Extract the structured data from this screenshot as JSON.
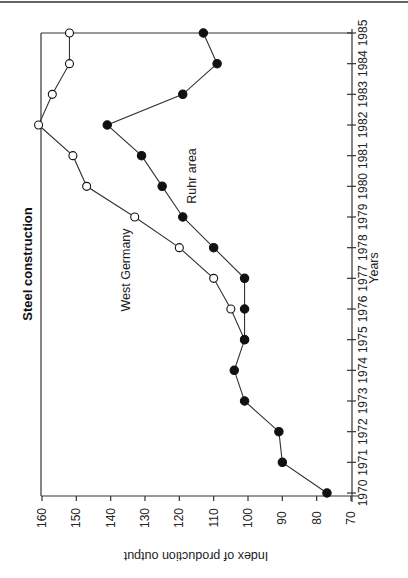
{
  "chart_data": {
    "type": "line",
    "orientation": "rotated-90-clockwise",
    "title": "Steel construction",
    "xlabel": "Years",
    "ylabel": "Index of production output",
    "x": [
      1970,
      1971,
      1972,
      1973,
      1974,
      1975,
      1976,
      1977,
      1978,
      1979,
      1980,
      1981,
      1982,
      1983,
      1984,
      1985
    ],
    "ylim": [
      70,
      160
    ],
    "y_ticks": [
      70,
      80,
      90,
      100,
      110,
      120,
      130,
      140,
      150,
      160
    ],
    "grid": false,
    "series": [
      {
        "name": "Ruhr area",
        "marker": "filled-circle",
        "values": [
          77,
          90,
          91,
          101,
          104,
          101,
          101,
          101,
          110,
          119,
          125,
          131,
          141,
          119,
          109,
          113
        ]
      },
      {
        "name": "West Germany",
        "marker": "open-circle",
        "values": [
          null,
          null,
          null,
          null,
          null,
          101,
          105,
          110,
          120,
          133,
          147,
          151,
          161,
          157,
          152,
          152
        ]
      }
    ],
    "annotations": [
      {
        "text": "West Germany",
        "series": "West Germany"
      },
      {
        "text": "Ruhr area",
        "series": "Ruhr area"
      }
    ]
  },
  "layout": {
    "value_px_at_160": 42,
    "value_px_at_70": 351,
    "year_px_at_1970": 493,
    "year_px_at_1985": 33,
    "frame_left": 41,
    "frame_top": 33,
    "frame_bottom": 496,
    "axis_right": 352
  }
}
